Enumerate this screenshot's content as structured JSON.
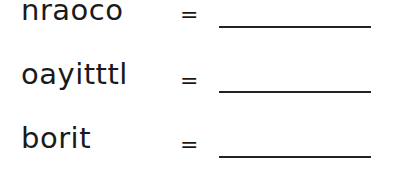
{
  "worksheet": {
    "rows": [
      {
        "scrambled": "nraoco",
        "equals": "=",
        "answer": ""
      },
      {
        "scrambled": "oayitttl",
        "equals": "=",
        "answer": ""
      },
      {
        "scrambled": "borit",
        "equals": "=",
        "answer": ""
      }
    ]
  }
}
